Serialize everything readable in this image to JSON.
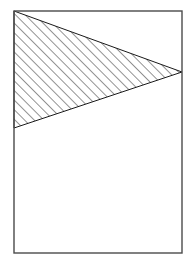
{
  "figure": {
    "title": "Hatched triangular region inside a rectangular frame",
    "canvas": {
      "width": 195,
      "height": 264,
      "background_color": "#ffffff"
    },
    "frame": {
      "name": "rectangle-frame",
      "x": 14,
      "y": 11,
      "width": 168,
      "height": 242,
      "stroke_color": "#4a4a4a",
      "stroke_width": 1.4,
      "fill_color": "none"
    },
    "shaded_region": {
      "name": "hatched-triangle",
      "shape": "triangle",
      "points": "14,11 182,72 14,128",
      "vertices": [
        {
          "label": "top-left",
          "x": 14,
          "y": 11
        },
        {
          "label": "right-apex",
          "x": 182,
          "y": 72
        },
        {
          "label": "bottom-left",
          "x": 14,
          "y": 128
        }
      ],
      "stroke_color": "#1a1a1a",
      "stroke_width": 1.0,
      "fill": "diagonal-hatch"
    },
    "hatch": {
      "name": "diagonal-hatch-pattern",
      "direction": "forward-slash",
      "angle_degrees": 45,
      "spacing_px": 4.8,
      "line_color": "#111111",
      "line_width": 0.9
    }
  }
}
